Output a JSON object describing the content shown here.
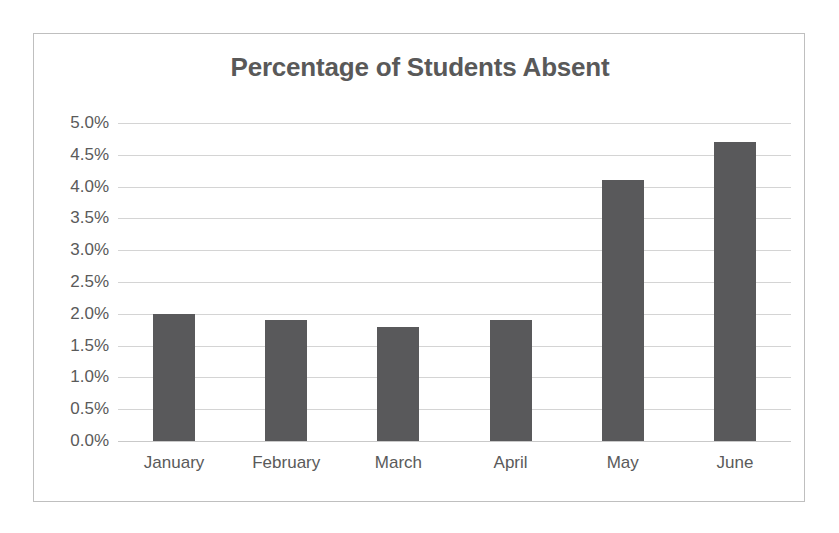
{
  "chart_data": {
    "type": "bar",
    "title": "Percentage of Students Absent",
    "xlabel": "",
    "ylabel": "",
    "categories": [
      "January",
      "February",
      "March",
      "April",
      "May",
      "June"
    ],
    "values": [
      2.0,
      1.9,
      1.8,
      1.9,
      4.1,
      4.7
    ],
    "value_labels": [
      "2.0%",
      "1.9%",
      "1.8%",
      "1.9%",
      "4.1%",
      "4.7%"
    ],
    "ylim": [
      0.0,
      5.0
    ],
    "ytick_step": 0.5,
    "ytick_labels": [
      "5.0%",
      "4.5%",
      "4.0%",
      "3.5%",
      "3.0%",
      "2.5%",
      "2.0%",
      "1.5%",
      "1.0%",
      "0.5%",
      "0.0%"
    ],
    "ytick_values": [
      5.0,
      4.5,
      4.0,
      3.5,
      3.0,
      2.5,
      2.0,
      1.5,
      1.0,
      0.5,
      0.0
    ],
    "grid": true,
    "legend": false,
    "legend_position": "none",
    "series": [
      {
        "name": "Percentage of Students Absent",
        "values": [
          2.0,
          1.9,
          1.8,
          1.9,
          4.1,
          4.7
        ]
      }
    ],
    "colors": {
      "bar": "#59595B",
      "title": "#595959",
      "tick_label": "#5A5A5A",
      "gridline": "#D4D4D4",
      "frame_border": "#BFBFBF",
      "background": "#FFFFFF"
    }
  }
}
